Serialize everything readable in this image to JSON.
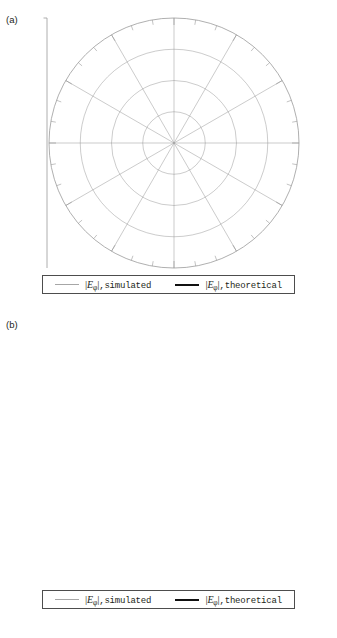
{
  "figure": {
    "panels": [
      {
        "letter": "(a)",
        "radial_axis_label": "(dB)",
        "radial_ticks": [
          "0",
          "-10",
          "-20",
          "-30",
          "-40",
          "-30",
          "-20",
          "-10",
          "0"
        ],
        "inset_axes": {
          "vertical": "x",
          "horizontal": "y"
        },
        "angle_labels": [
          "0",
          "30",
          "60",
          "90",
          "120",
          "150",
          "180",
          "210",
          "240",
          "270",
          "300",
          "330"
        ],
        "legend": [
          {
            "style": "thin-gray",
            "quantity": "E",
            "subscript": "φ",
            "text": ",simulated"
          },
          {
            "style": "thick-black",
            "quantity": "E",
            "subscript": "φ",
            "text": ",theoretical"
          }
        ]
      },
      {
        "letter": "(b)",
        "radial_axis_label": "(dB)",
        "radial_ticks": [
          "0",
          "-10",
          "-20",
          "-30",
          "-40",
          "-30",
          "-20",
          "-10",
          "0"
        ],
        "inset_axes": {
          "vertical": "z",
          "horizontal": "x"
        },
        "angle_labels": [
          "0",
          "30",
          "60",
          "90",
          "120",
          "150",
          "180",
          "-150",
          "-120",
          "-90",
          "-60",
          "-30"
        ],
        "legend": [
          {
            "style": "thin-gray",
            "quantity": "E",
            "subscript": "φ",
            "text": ",simulated"
          },
          {
            "style": "thick-black",
            "quantity": "E",
            "subscript": "φ",
            "text": ",theoretical"
          }
        ]
      }
    ]
  },
  "chart_data": [
    {
      "type": "line",
      "plot_kind": "polar-radiation-pattern",
      "panel": "(a)",
      "title": "",
      "xlabel": "",
      "ylabel": "(dB)",
      "angular_unit": "degrees",
      "angular_ticks": [
        0,
        30,
        60,
        90,
        120,
        150,
        180,
        210,
        240,
        270,
        300,
        330
      ],
      "angular_minor_tick_step": 10,
      "radial_label_values": [
        0,
        -10,
        -20,
        -30,
        -40,
        -30,
        -20,
        -10,
        0
      ],
      "rlim": [
        -40,
        0
      ],
      "grid": true,
      "legend_position": "below",
      "plane": "xy-plane (phi cut)",
      "series": [
        {
          "name": "|Eφ|, simulated",
          "color": "#a6a6a6",
          "linewidth": 1.0,
          "angles": [
            0,
            10,
            20,
            30,
            40,
            50,
            60,
            70,
            80,
            85,
            90,
            95,
            100,
            110,
            120,
            130,
            140,
            150,
            160,
            170,
            180,
            190,
            200,
            210,
            220,
            230,
            240,
            250,
            260,
            265,
            270,
            275,
            280,
            290,
            300,
            310,
            320,
            330,
            340,
            350,
            360
          ],
          "values_db": [
            0,
            -0.4,
            -1.2,
            -2.0,
            -3.0,
            -4.2,
            -5.6,
            -7.6,
            -11.0,
            -16.0,
            -40,
            -16.0,
            -11.0,
            -7.6,
            -5.6,
            -4.2,
            -3.0,
            -2.0,
            -1.2,
            -0.4,
            0,
            -0.4,
            -1.2,
            -2.0,
            -3.0,
            -4.2,
            -5.6,
            -7.6,
            -11.0,
            -16.0,
            -40,
            -16.0,
            -11.0,
            -7.6,
            -5.6,
            -4.2,
            -3.0,
            -2.0,
            -1.2,
            -0.4,
            0
          ]
        },
        {
          "name": "|Eφ|, theoretical",
          "color": "#111111",
          "linewidth": 2.4,
          "angles": [
            0,
            10,
            20,
            30,
            40,
            50,
            60,
            70,
            75,
            80,
            85,
            88,
            90,
            92,
            95,
            100,
            105,
            110,
            120,
            130,
            140,
            150,
            160,
            170,
            180,
            190,
            200,
            210,
            220,
            230,
            240,
            250,
            255,
            260,
            265,
            268,
            270,
            272,
            275,
            280,
            285,
            290,
            300,
            310,
            320,
            330,
            340,
            350,
            360
          ],
          "values_db": [
            0,
            -0.5,
            -1.5,
            -2.6,
            -3.9,
            -5.4,
            -7.4,
            -10.4,
            -12.6,
            -16.0,
            -22.0,
            -30.0,
            -40,
            -30.0,
            -22.0,
            -16.0,
            -13.0,
            -10.4,
            -7.4,
            -5.4,
            -3.9,
            -2.6,
            -1.5,
            -0.5,
            0,
            -0.5,
            -1.5,
            -2.6,
            -3.9,
            -5.4,
            -7.4,
            -10.4,
            -12.6,
            -16.0,
            -22.0,
            -30.0,
            -40,
            -30.0,
            -22.0,
            -16.0,
            -13.0,
            -10.4,
            -7.4,
            -5.4,
            -3.9,
            -2.6,
            -1.5,
            -0.5,
            0
          ]
        }
      ]
    },
    {
      "type": "line",
      "plot_kind": "polar-radiation-pattern",
      "panel": "(b)",
      "title": "",
      "xlabel": "",
      "ylabel": "(dB)",
      "angular_unit": "degrees",
      "angular_ticks": [
        0,
        30,
        60,
        90,
        120,
        150,
        180,
        -150,
        -120,
        -90,
        -60,
        -30
      ],
      "angular_minor_tick_step": 10,
      "radial_label_values": [
        0,
        -10,
        -20,
        -30,
        -40,
        -30,
        -20,
        -10,
        0
      ],
      "rlim": [
        -40,
        0
      ],
      "grid": true,
      "legend_position": "below",
      "plane": "zx-plane (theta cut)",
      "series": [
        {
          "name": "|Eφ|, simulated",
          "color": "#a6a6a6",
          "linewidth": 1.0,
          "angles": [
            0,
            30,
            60,
            90,
            120,
            150,
            180,
            210,
            240,
            270,
            300,
            330,
            360
          ],
          "values_db": [
            0,
            0,
            0,
            0,
            0,
            0,
            0,
            0,
            0,
            0,
            0,
            0,
            0
          ]
        },
        {
          "name": "|Eφ|, theoretical",
          "color": "#111111",
          "linewidth": 2.4,
          "angles": [
            0,
            30,
            60,
            90,
            120,
            150,
            180,
            210,
            240,
            270,
            300,
            330,
            360
          ],
          "values_db": [
            -0.6,
            -0.6,
            -0.6,
            -0.6,
            -0.6,
            -0.6,
            -0.6,
            -0.6,
            -0.6,
            -0.6,
            -0.6,
            -0.6,
            -0.6
          ]
        }
      ]
    }
  ],
  "colors": {
    "simulated": "#a6a6a6",
    "theoretical": "#111111",
    "grid": "#9a9a9a",
    "text": "#231f20"
  }
}
